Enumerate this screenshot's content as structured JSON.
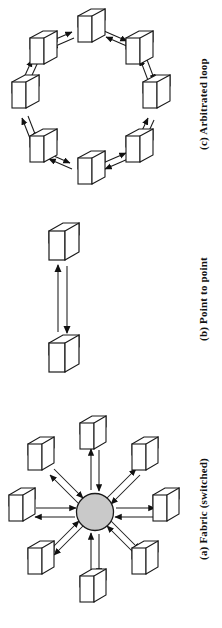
{
  "figure": {
    "background_color": "#ffffff",
    "line_color": "#1a1a1a",
    "box_face_color": "#ffffff",
    "switch_fill_color": "#c9c9c9"
  },
  "panels": [
    {
      "id": "arbitrated-loop",
      "caption": "(c) Arbitrated loop",
      "topology": "ring",
      "node_count": 8,
      "node_shape": "3d-box",
      "link_style": "bidirectional-arrow-pair",
      "center_x": 88,
      "center_y": 100,
      "ring_radius": 68
    },
    {
      "id": "point-to-point",
      "caption": "(b) Point to point",
      "topology": "point-to-point",
      "node_count": 2,
      "node_shape": "3d-box",
      "link_style": "bidirectional-arrow-pair",
      "node_a": {
        "x": 66,
        "y": 30
      },
      "node_b": {
        "x": 66,
        "y": 148
      }
    },
    {
      "id": "fabric-switched",
      "caption": "(a) Fabric (switched)",
      "topology": "star",
      "node_count": 8,
      "node_shape": "3d-box",
      "hub_shape": "circle",
      "hub_label": "",
      "link_style": "bidirectional-arrow-pair",
      "center_x": 95,
      "center_y": 122,
      "ring_radius": 72,
      "hub_radius": 18
    }
  ],
  "captions": {
    "loop": "(c) Arbitrated loop",
    "p2p": "(b) Point to point",
    "fabric": "(a) Fabric (switched)"
  }
}
